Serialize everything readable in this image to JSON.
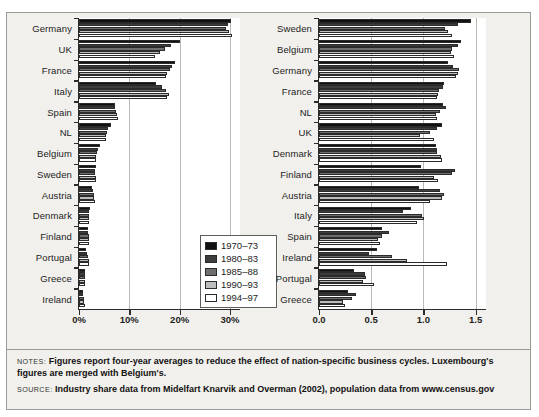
{
  "notes": {
    "notes_tag": "NOTES:",
    "notes_text": "Figures report four-year averages to reduce the effect of nation-specific business cycles. Luxembourg's figures are merged with Belgium's.",
    "source_tag": "SOURCE:",
    "source_text": "Industry share data from Midelfart Knarvik and Overman (2002), population data from www.census.gov"
  },
  "legend": {
    "entries": [
      {
        "label": "1970–73",
        "color": "#111111"
      },
      {
        "label": "1980–83",
        "color": "#3d3d3d"
      },
      {
        "label": "1985–88",
        "color": "#6e6e6e"
      },
      {
        "label": "1990–93",
        "color": "#bdbdbd"
      },
      {
        "label": "1994–97",
        "color": "#ffffff"
      }
    ]
  },
  "chart_data": [
    {
      "type": "bar",
      "orientation": "horizontal",
      "id": "left-chart",
      "title": "",
      "xlabel": "",
      "ylabel": "",
      "xlim": [
        0,
        32
      ],
      "xticks": [
        0,
        10,
        20,
        30
      ],
      "xticklabels": [
        "0%",
        "10%",
        "20%",
        "30%"
      ],
      "grid": true,
      "legend_position": "inside-right-lower",
      "categories": [
        "Germany",
        "UK",
        "France",
        "Italy",
        "Spain",
        "NL",
        "Belgium",
        "Sweden",
        "Austria",
        "Denmark",
        "Finland",
        "Portugal",
        "Greece",
        "Ireland"
      ],
      "series": [
        {
          "name": "1970–73",
          "values": [
            30.2,
            20.1,
            19.0,
            15.3,
            7.2,
            6.4,
            4.2,
            3.4,
            2.6,
            2.1,
            1.7,
            1.4,
            1.2,
            0.8
          ]
        },
        {
          "name": "1980–83",
          "values": [
            29.6,
            18.2,
            18.5,
            16.5,
            7.1,
            5.8,
            3.8,
            3.2,
            2.7,
            2.0,
            1.8,
            1.6,
            1.2,
            0.8
          ]
        },
        {
          "name": "1985–88",
          "values": [
            29.2,
            17.0,
            18.0,
            17.2,
            7.4,
            5.6,
            3.6,
            3.2,
            2.9,
            1.9,
            1.9,
            1.8,
            1.2,
            0.9
          ]
        },
        {
          "name": "1990–93",
          "values": [
            29.8,
            16.0,
            17.5,
            17.8,
            7.6,
            5.4,
            3.4,
            3.3,
            3.0,
            1.9,
            2.0,
            1.9,
            1.1,
            1.0
          ]
        },
        {
          "name": "1994–97",
          "values": [
            30.4,
            15.2,
            17.2,
            17.4,
            7.8,
            5.3,
            3.3,
            3.3,
            3.1,
            1.9,
            2.0,
            2.0,
            1.1,
            1.1
          ]
        }
      ]
    },
    {
      "type": "bar",
      "orientation": "horizontal",
      "id": "right-chart",
      "title": "",
      "xlabel": "",
      "ylabel": "",
      "xlim": [
        0,
        1.6
      ],
      "xticks": [
        0.0,
        0.5,
        1.0,
        1.5
      ],
      "xticklabels": [
        "0.0",
        "0.5",
        "1.0",
        "1.5"
      ],
      "grid": true,
      "legend_position": "inside-right-lower",
      "categories": [
        "Sweden",
        "Belgium",
        "Germany",
        "France",
        "NL",
        "UK",
        "Denmark",
        "Finland",
        "Austria",
        "Italy",
        "Spain",
        "Ireland",
        "Portugal",
        "Greece"
      ],
      "series": [
        {
          "name": "1970–73",
          "values": [
            1.46,
            1.36,
            1.24,
            1.2,
            1.19,
            1.18,
            1.12,
            0.98,
            0.96,
            0.88,
            0.6,
            0.56,
            0.34,
            0.28
          ]
        },
        {
          "name": "1980–83",
          "values": [
            1.33,
            1.33,
            1.28,
            1.19,
            1.22,
            1.13,
            1.13,
            1.3,
            1.16,
            0.8,
            0.67,
            0.48,
            0.44,
            0.35
          ]
        },
        {
          "name": "1985–88",
          "values": [
            1.21,
            1.27,
            1.34,
            1.15,
            1.16,
            1.06,
            1.13,
            1.27,
            1.2,
            0.99,
            0.6,
            0.7,
            0.45,
            0.32
          ]
        },
        {
          "name": "1990–93",
          "values": [
            1.24,
            1.26,
            1.33,
            1.14,
            1.12,
            0.97,
            1.17,
            1.1,
            1.18,
            1.01,
            0.57,
            0.84,
            0.42,
            0.23
          ]
        },
        {
          "name": "1994–97",
          "values": [
            1.27,
            1.29,
            1.31,
            1.13,
            1.13,
            1.1,
            1.18,
            1.14,
            1.06,
            0.94,
            0.58,
            1.23,
            0.53,
            0.25
          ]
        }
      ]
    }
  ]
}
